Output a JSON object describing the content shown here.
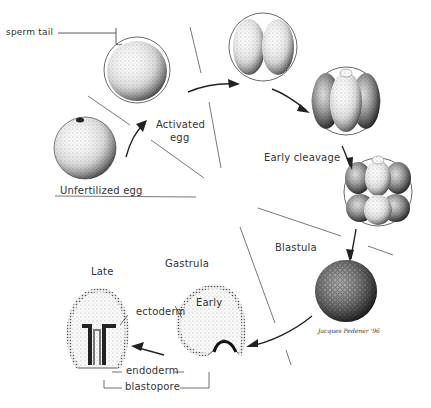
{
  "diagram": {
    "colors": {
      "ink": "#222222",
      "background": "#ffffff",
      "stipple": "#555555"
    },
    "labels": {
      "sperm_tail": "sperm tail",
      "activated_egg_line1": "Activated",
      "activated_egg_line2": "egg",
      "unfertilized_egg": "Unfertilized egg",
      "early_cleavage": "Early cleavage",
      "blastula": "Blastula",
      "gastrula": "Gastrula",
      "late": "Late",
      "early": "Early",
      "ectoderm": "ectoderm",
      "endoderm": "endoderm",
      "blastopore": "blastopore",
      "signature": "Jacques Pedener '96"
    },
    "stages": [
      {
        "name": "Unfertilized egg"
      },
      {
        "name": "Activated egg"
      },
      {
        "name": "Two-cell stage"
      },
      {
        "name": "Four-cell stage"
      },
      {
        "name": "Eight-cell stage"
      },
      {
        "name": "Blastula"
      },
      {
        "name": "Early gastrula"
      },
      {
        "name": "Late gastrula"
      }
    ]
  }
}
